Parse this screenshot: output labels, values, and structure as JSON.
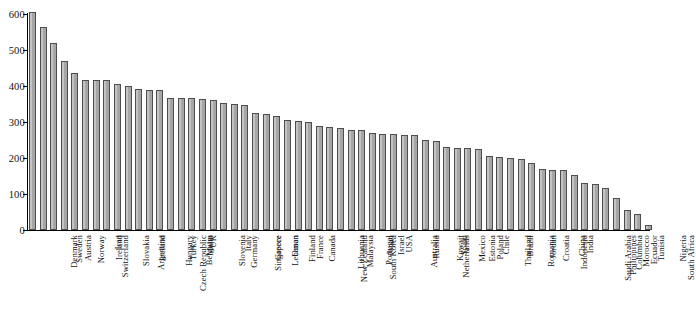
{
  "chart_data": {
    "type": "bar",
    "title": "",
    "xlabel": "",
    "ylabel": "",
    "ylim": [
      0,
      600
    ],
    "yticks": [
      0,
      100,
      200,
      300,
      400,
      500,
      600
    ],
    "grid": false,
    "legend": null,
    "bar_color": "#a6a6a6",
    "bar_edge_color": "#4d4d4d",
    "categories": [
      "Denmark",
      "Sweden",
      "Austria",
      "Norway",
      "Switzerland",
      "Ireland",
      "Iran",
      "Slovakia",
      "Argentina",
      "Iceland",
      "Czech Republic",
      "Hungary",
      "Turkey",
      "Belgium",
      "Malta",
      "UK",
      "Slovenia",
      "Germany",
      "Italy",
      "Singapore",
      "Greece",
      "Lebanon",
      "Oman",
      "Finland",
      "France",
      "Canada",
      "New Zealand",
      "Lithuania",
      "Malaysia",
      "South Korea",
      "Portugal",
      "Japan",
      "Israel",
      "USA",
      "Australia",
      "Russia",
      "Netherlands",
      "Kuwait",
      "Spain",
      "Mexico",
      "Estonia",
      "Poland",
      "Chile",
      "Thailand",
      "Brazil",
      "Romania",
      "Jordan",
      "Croatia",
      "Indonesia",
      "China",
      "India",
      "Saudi Arabia",
      "Philippines",
      "Columbia",
      "Morocco",
      "Ecuador",
      "Tunisia",
      "South Africa",
      "Nigeria"
    ],
    "values": [
      605,
      565,
      520,
      470,
      435,
      418,
      418,
      418,
      405,
      400,
      392,
      390,
      388,
      368,
      367,
      367,
      365,
      362,
      352,
      350,
      348,
      325,
      322,
      318,
      305,
      302,
      300,
      288,
      285,
      282,
      278,
      278,
      270,
      268,
      267,
      265,
      263,
      250,
      248,
      230,
      228,
      228,
      225,
      205,
      203,
      200,
      198,
      185,
      170,
      168,
      167,
      152,
      130,
      127,
      118,
      88,
      55,
      45,
      15
    ]
  }
}
